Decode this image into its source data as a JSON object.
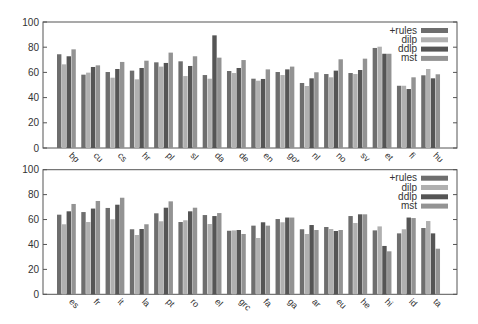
{
  "chart_data": [
    {
      "type": "bar",
      "title": "",
      "xlabel": "",
      "ylabel": "",
      "ylim": [
        0,
        100
      ],
      "yticks": [
        0,
        20,
        40,
        60,
        80,
        100
      ],
      "grid": false,
      "legend_position": "top-right",
      "categories": [
        "bg",
        "cu",
        "cs",
        "hr",
        "pl",
        "sl",
        "da",
        "de",
        "en",
        "got",
        "nl",
        "no",
        "sv",
        "et",
        "fi",
        "hu"
      ],
      "series": [
        {
          "name": "+rules",
          "color": "#6e6e6e",
          "values": [
            74.4,
            58.2,
            60.3,
            61.4,
            68.0,
            68.8,
            57.9,
            61.1,
            55.0,
            60.3,
            51.6,
            58.7,
            59.5,
            79.4,
            49.4,
            57.7
          ]
        },
        {
          "name": "dilp",
          "color": "#b0b0b0",
          "values": [
            66.4,
            59.8,
            55.8,
            54.5,
            64.6,
            57.1,
            55.0,
            59.5,
            53.4,
            57.9,
            49.2,
            56.1,
            58.7,
            80.4,
            49.4,
            62.7
          ]
        },
        {
          "name": "ddlp",
          "color": "#555555",
          "values": [
            72.8,
            64.3,
            62.7,
            63.5,
            67.5,
            65.1,
            89.4,
            63.5,
            54.8,
            62.4,
            55.3,
            61.4,
            61.9,
            74.8,
            46.8,
            55.3
          ]
        },
        {
          "name": "mst",
          "color": "#939393",
          "values": [
            78.3,
            65.6,
            68.3,
            69.3,
            75.7,
            72.8,
            71.7,
            69.8,
            62.4,
            64.6,
            60.1,
            70.4,
            70.9,
            74.8,
            56.1,
            58.5
          ]
        }
      ]
    },
    {
      "type": "bar",
      "title": "",
      "xlabel": "",
      "ylabel": "",
      "ylim": [
        0,
        100
      ],
      "yticks": [
        0,
        20,
        40,
        60,
        80,
        100
      ],
      "grid": false,
      "legend_position": "top-right",
      "categories": [
        "es",
        "fr",
        "it",
        "la",
        "pt",
        "ro",
        "el",
        "grc",
        "fa",
        "ga",
        "ar",
        "eu",
        "he",
        "hi",
        "id",
        "ta"
      ],
      "series": [
        {
          "name": "+rules",
          "color": "#6e6e6e",
          "values": [
            63.9,
            66.0,
            69.3,
            52.2,
            65.0,
            58.0,
            63.6,
            51.0,
            55.1,
            60.4,
            52.2,
            54.0,
            62.8,
            51.3,
            48.9,
            53.2
          ]
        },
        {
          "name": "dilp",
          "color": "#b0b0b0",
          "values": [
            56.2,
            58.0,
            60.2,
            47.6,
            58.6,
            59.4,
            56.4,
            51.3,
            45.2,
            57.8,
            48.4,
            52.4,
            57.2,
            54.5,
            52.2,
            58.8
          ]
        },
        {
          "name": "ddlp",
          "color": "#555555",
          "values": [
            66.6,
            68.8,
            71.9,
            52.4,
            69.5,
            66.6,
            62.8,
            51.6,
            57.8,
            61.6,
            55.6,
            50.8,
            64.2,
            38.8,
            61.6,
            48.9
          ]
        },
        {
          "name": "mst",
          "color": "#939393",
          "values": [
            72.5,
            74.9,
            77.5,
            56.2,
            74.6,
            69.5,
            65.2,
            48.4,
            55.1,
            61.6,
            51.6,
            51.6,
            64.2,
            34.5,
            61.2,
            36.6
          ]
        }
      ]
    }
  ],
  "legend": {
    "items": [
      {
        "label": "+rules",
        "color": "#6e6e6e"
      },
      {
        "label": "dilp",
        "color": "#b0b0b0"
      },
      {
        "label": "ddlp",
        "color": "#555555"
      },
      {
        "label": "mst",
        "color": "#939393"
      }
    ]
  }
}
